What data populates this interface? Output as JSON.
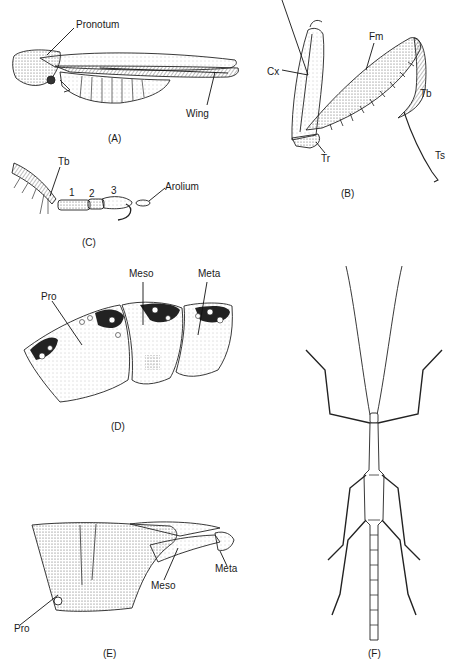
{
  "figure": {
    "panels": [
      {
        "id": "A",
        "caption": "(A)",
        "subject": "grasshopper nymph lateral view",
        "labels": [
          "Pronotum",
          "Wing"
        ]
      },
      {
        "id": "B",
        "caption": "(B)",
        "subject": "raptorial foreleg of mantid",
        "labels": [
          "Cx",
          "Fm",
          "Tb",
          "Tr",
          "Ts"
        ]
      },
      {
        "id": "C",
        "caption": "(C)",
        "subject": "tarsus with arolium",
        "labels": [
          "Tb",
          "1",
          "2",
          "3",
          "Arolium"
        ]
      },
      {
        "id": "D",
        "caption": "(D)",
        "subject": "thoracic segments lateral (pronotum, mesonotum, metanotum)",
        "labels": [
          "Pro",
          "Meso",
          "Meta"
        ]
      },
      {
        "id": "E",
        "caption": "(E)",
        "subject": "thoracic sterna",
        "labels": [
          "Pro",
          "Meso",
          "Meta"
        ]
      },
      {
        "id": "F",
        "caption": "(F)",
        "subject": "walking stick dorsal view",
        "labels": []
      }
    ]
  },
  "A": {
    "pronotum": "Pronotum",
    "wing": "Wing",
    "caption": "(A)"
  },
  "B": {
    "cx": "Cx",
    "fm": "Fm",
    "tb": "Tb",
    "tr": "Tr",
    "ts": "Ts",
    "caption": "(B)"
  },
  "C": {
    "tb": "Tb",
    "n1": "1",
    "n2": "2",
    "n3": "3",
    "arolium": "Arolium",
    "caption": "(C)"
  },
  "D": {
    "pro": "Pro",
    "meso": "Meso",
    "meta": "Meta",
    "caption": "(D)"
  },
  "E": {
    "pro": "Pro",
    "meso": "Meso",
    "meta": "Meta",
    "caption": "(E)"
  },
  "F": {
    "caption": "(F)"
  }
}
